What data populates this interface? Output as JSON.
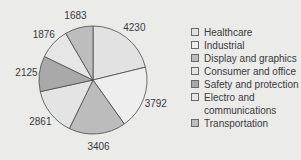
{
  "chart_data": {
    "type": "pie",
    "title": "",
    "categories": [
      "Healthcare",
      "Industrial",
      "Display and graphics",
      "Consumer and office",
      "Safety and protection",
      "Electro and communications",
      "Transportation"
    ],
    "values": [
      4230,
      3792,
      3406,
      2861,
      2125,
      1876,
      1683
    ],
    "colors": [
      "#e2e2e2",
      "#eeeeee",
      "#bcbcbc",
      "#e4e4e4",
      "#a9a9a9",
      "#e6e6e6",
      "#bdbdbd"
    ],
    "start_angle_deg": 0,
    "direction": "clockwise",
    "legend_position": "right",
    "data_labels": true
  },
  "legend": {
    "items": [
      {
        "label": "Healthcare",
        "color": "#e2e2e2"
      },
      {
        "label": "Industrial",
        "color": "#eeeeee"
      },
      {
        "label": "Display and graphics",
        "color": "#bcbcbc"
      },
      {
        "label": "Consumer and office",
        "color": "#e4e4e4"
      },
      {
        "label": "Safety and protection",
        "color": "#a9a9a9"
      },
      {
        "label": "Electro and communications",
        "color": "#e6e6e6"
      },
      {
        "label": "Transportation",
        "color": "#bdbdbd"
      }
    ]
  }
}
